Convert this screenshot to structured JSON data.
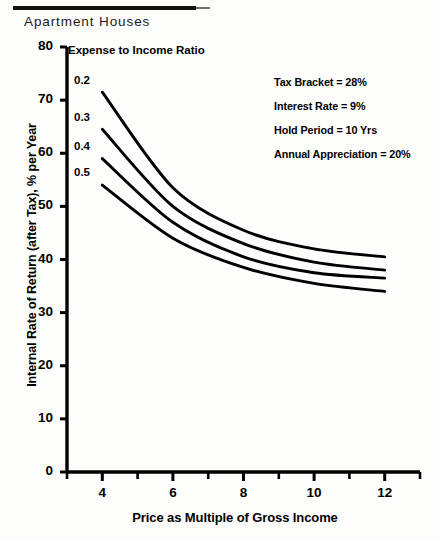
{
  "document": {
    "title": "Apartment Houses"
  },
  "chart_data": {
    "type": "line",
    "title": "Apartment Houses",
    "xlabel": "Price as Multiple of Gross Income",
    "ylabel": "Internal Rate of Return (after Tax), % per Year",
    "xlim": [
      3,
      13
    ],
    "ylim": [
      0,
      80
    ],
    "xticks": [
      4,
      6,
      8,
      10,
      12
    ],
    "xtick_labels": [
      "4",
      "6",
      "8",
      "10",
      "12"
    ],
    "xminor_step": 1,
    "yticks": [
      0,
      10,
      20,
      30,
      40,
      50,
      60,
      70,
      80
    ],
    "ytick_labels": [
      "0",
      "10",
      "20",
      "30",
      "40",
      "50",
      "60",
      "70",
      "80"
    ],
    "grid": false,
    "legend_title": "Expense to Income Ratio",
    "legend_position": "inline-left-labels",
    "x": [
      4,
      6,
      8,
      10,
      12
    ],
    "series": [
      {
        "name": "0.2",
        "label": "0.2",
        "values": [
          71.5,
          53.5,
          45.5,
          42.0,
          40.5
        ]
      },
      {
        "name": "0.3",
        "label": "0.3",
        "values": [
          64.5,
          50.0,
          43.0,
          39.5,
          38.0
        ]
      },
      {
        "name": "0.4",
        "label": "0.4",
        "values": [
          59.0,
          47.0,
          40.5,
          37.5,
          36.5
        ]
      },
      {
        "name": "0.5",
        "label": "0.5",
        "values": [
          54.0,
          44.0,
          38.5,
          35.5,
          34.0
        ]
      }
    ],
    "annotations": [
      "Tax Bracket = 28%",
      "Interest Rate = 9%",
      "Hold Period = 10 Yrs",
      "Annual Appreciation = 20%"
    ],
    "line_color": "#000000"
  }
}
